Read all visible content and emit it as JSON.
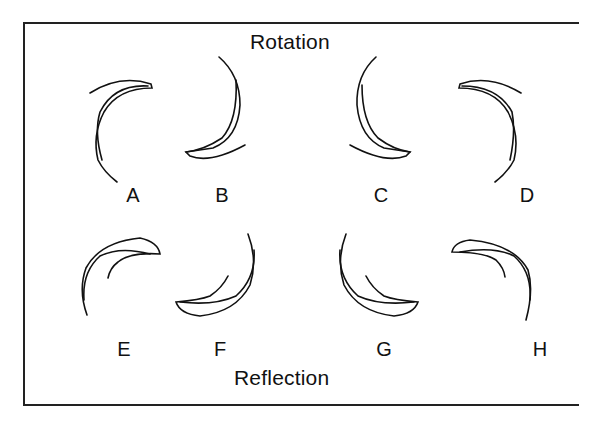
{
  "diagram": {
    "top_title": "Rotation",
    "bottom_title": "Reflection",
    "figures": [
      {
        "label": "A",
        "group": "rotation"
      },
      {
        "label": "B",
        "group": "rotation"
      },
      {
        "label": "C",
        "group": "rotation"
      },
      {
        "label": "D",
        "group": "rotation"
      },
      {
        "label": "E",
        "group": "reflection"
      },
      {
        "label": "F",
        "group": "reflection"
      },
      {
        "label": "G",
        "group": "reflection"
      },
      {
        "label": "H",
        "group": "reflection"
      }
    ],
    "colors": {
      "stroke": "#111111",
      "background": "#ffffff"
    }
  }
}
